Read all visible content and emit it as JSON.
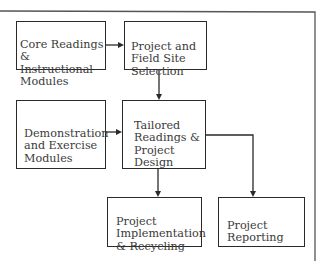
{
  "diagram": {
    "type": "flowchart",
    "nodes": [
      {
        "id": "core-readings",
        "label": "Core Readings &\nInstructional\nModules"
      },
      {
        "id": "site-selection",
        "label": "Project and\nField Site\nSelection"
      },
      {
        "id": "demo-modules",
        "label": "Demonstration\nand Exercise\nModules"
      },
      {
        "id": "tailored-readings",
        "label": "Tailored\nReadings &\nProject\nDesign"
      },
      {
        "id": "implementation",
        "label": "Project\nImplementation\n& Recycling"
      },
      {
        "id": "reporting",
        "label": "Project\nReporting"
      }
    ],
    "edges": [
      {
        "from": "core-readings",
        "to": "site-selection"
      },
      {
        "from": "site-selection",
        "to": "tailored-readings"
      },
      {
        "from": "demo-modules",
        "to": "tailored-readings"
      },
      {
        "from": "tailored-readings",
        "to": "implementation"
      },
      {
        "from": "tailored-readings",
        "to": "reporting"
      }
    ],
    "colors": {
      "line": "#2a2a2a",
      "text": "#3a3a3a",
      "frame": "#555555",
      "background": "#ffffff"
    }
  }
}
